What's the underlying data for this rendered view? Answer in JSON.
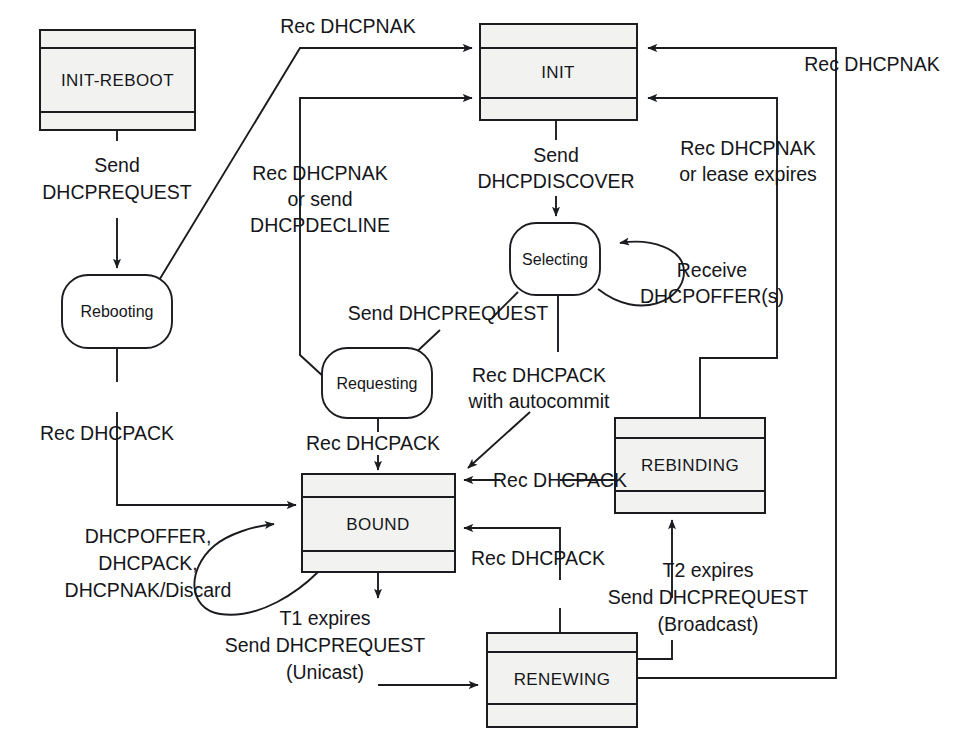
{
  "diagram": {
    "type": "state-machine",
    "states": [
      {
        "id": "init-reboot",
        "label": "INIT-REBOOT",
        "shape": "rect"
      },
      {
        "id": "init",
        "label": "INIT",
        "shape": "rect"
      },
      {
        "id": "selecting",
        "label": "Selecting",
        "shape": "rounded"
      },
      {
        "id": "requesting",
        "label": "Requesting",
        "shape": "rounded"
      },
      {
        "id": "rebooting",
        "label": "Rebooting",
        "shape": "rounded"
      },
      {
        "id": "bound",
        "label": "BOUND",
        "shape": "rect"
      },
      {
        "id": "renewing",
        "label": "RENEWING",
        "shape": "rect"
      },
      {
        "id": "rebinding",
        "label": "REBINDING",
        "shape": "rect"
      }
    ],
    "transitions": [
      {
        "id": "t1",
        "from": "init-reboot",
        "to": "rebooting",
        "label_lines": [
          "Send",
          "DHCPREQUEST"
        ]
      },
      {
        "id": "t2",
        "from": "rebooting",
        "to": "init",
        "label_lines": [
          "Rec DHCPNAK"
        ]
      },
      {
        "id": "t3",
        "from": "rebooting",
        "to": "bound",
        "label_lines": [
          "Rec DHCPACK"
        ]
      },
      {
        "id": "t4",
        "from": "requesting",
        "to": "init",
        "label_lines": [
          "Rec DHCPNAK",
          "or send",
          "DHCPDECLINE"
        ]
      },
      {
        "id": "t5",
        "from": "init",
        "to": "selecting",
        "label_lines": [
          "Send",
          "DHCPDISCOVER"
        ]
      },
      {
        "id": "t6",
        "from": "selecting",
        "to": "selecting",
        "label_lines": [
          "Receive",
          "DHCPOFFER(s)"
        ]
      },
      {
        "id": "t7",
        "from": "selecting",
        "to": "requesting",
        "label_lines": [
          "Send DHCPREQUEST"
        ]
      },
      {
        "id": "t8",
        "from": "selecting",
        "to": "bound",
        "label_lines": [
          "Rec DHCPACK",
          "with autocommit"
        ]
      },
      {
        "id": "t9",
        "from": "requesting",
        "to": "bound",
        "label_lines": [
          "Rec DHCPACK"
        ]
      },
      {
        "id": "t10",
        "from": "bound",
        "to": "bound",
        "label_lines": [
          "DHCPOFFER,",
          "DHCPACK,",
          "DHCPNAK/Discard"
        ]
      },
      {
        "id": "t11",
        "from": "bound",
        "to": "renewing",
        "label_lines": [
          "T1 expires",
          "Send DHCPREQUEST",
          "(Unicast)"
        ]
      },
      {
        "id": "t12",
        "from": "renewing",
        "to": "bound",
        "label_lines": [
          "Rec DHCPACK"
        ]
      },
      {
        "id": "t13",
        "from": "renewing",
        "to": "rebinding",
        "label_lines": [
          "T2 expires",
          "Send DHCPREQUEST",
          "(Broadcast)"
        ]
      },
      {
        "id": "t14",
        "from": "rebinding",
        "to": "bound",
        "label_lines": [
          "Rec DHCPACK"
        ]
      },
      {
        "id": "t15",
        "from": "rebinding",
        "to": "init",
        "label_lines": [
          "Rec DHCPNAK",
          "or lease expires"
        ]
      },
      {
        "id": "t16",
        "from": "renewing",
        "to": "init",
        "label_lines": [
          "Rec DHCPNAK"
        ]
      }
    ],
    "labels": {
      "init_reboot": "INIT-REBOOT",
      "init": "INIT",
      "selecting": "Selecting",
      "requesting": "Requesting",
      "rebooting": "Rebooting",
      "bound": "BOUND",
      "renewing": "RENEWING",
      "rebinding": "REBINDING",
      "send": "Send",
      "dhcprequest": "DHCPREQUEST",
      "rec_dhcpnak_top": "Rec DHCPNAK",
      "rec_dhcpnak_right": "Rec DHCPNAK",
      "rec_dhcpnak": "Rec DHCPNAK",
      "or_send": "or send",
      "dhcpdecline": "DHCPDECLINE",
      "send2": "Send",
      "dhcpdiscover": "DHCPDISCOVER",
      "rec_dhcpnak2": "Rec DHCPNAK",
      "or_lease_expires": "or lease expires",
      "receive": "Receive",
      "dhcpoffers": "DHCPOFFER(s)",
      "send_dhcprequest": "Send DHCPREQUEST",
      "rec_dhcpack_auto": "Rec DHCPACK",
      "with_autocommit": "with autocommit",
      "rec_dhcpack_reboot": "Rec DHCPACK",
      "rec_dhcpack_req": "Rec DHCPACK",
      "rec_dhcpack_rebind": "Rec DHCPACK",
      "rec_dhcpack_renew": "Rec DHCPACK",
      "dhcpoffer_c": "DHCPOFFER,",
      "dhcpack_c": "DHCPACK,",
      "dhcpnak_discard": "DHCPNAK/Discard",
      "t1_expires": "T1 expires",
      "send_dhcprequest_uni": "Send DHCPREQUEST",
      "unicast": "(Unicast)",
      "t2_expires": "T2 expires",
      "send_dhcprequest_bc": "Send DHCPREQUEST",
      "broadcast": "(Broadcast)"
    }
  }
}
